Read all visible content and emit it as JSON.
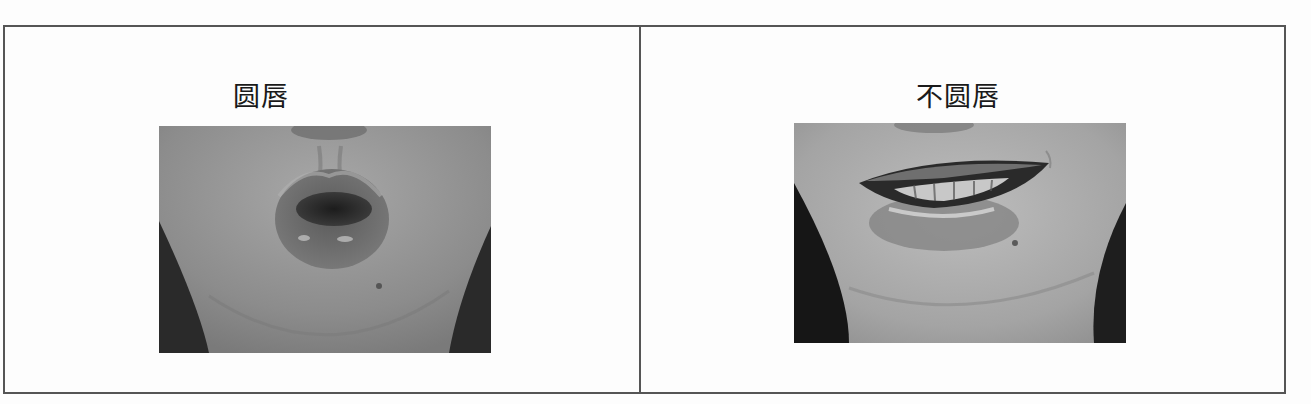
{
  "table": {
    "columns": [
      {
        "caption": "圆唇",
        "image": {
          "alt": "Close-up photo of lips in a rounded (protruded, O-shaped) position",
          "tone": "grayscale"
        }
      },
      {
        "caption": "不圆唇",
        "image": {
          "alt": "Close-up photo of lips in an unrounded (spread, smiling) position showing teeth",
          "tone": "grayscale"
        }
      }
    ]
  },
  "colors": {
    "border": "#555555",
    "text": "#1a1a1a",
    "background": "#fdfdfd"
  }
}
